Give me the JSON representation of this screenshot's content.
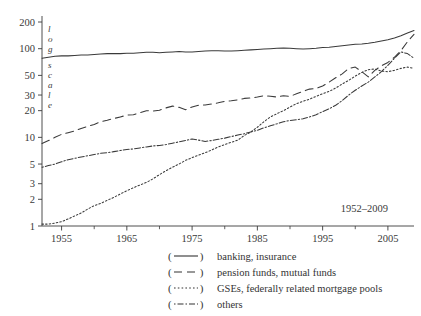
{
  "figure": {
    "period_annotation": "1952–2009",
    "axis_note": "log scale"
  },
  "chart_data": {
    "type": "line",
    "title": "",
    "subtitle": "",
    "xlabel": "",
    "ylabel": "log scale",
    "annotation": "1952–2009",
    "log_y": true,
    "grid": false,
    "legend_position": "below",
    "xlim": [
      1952,
      2009
    ],
    "ylim": [
      1,
      200
    ],
    "x_ticks": [
      1955,
      1965,
      1975,
      1985,
      1995,
      2005
    ],
    "x_tick_labels": [
      "1955",
      "1965",
      "1975",
      "1985",
      "1995",
      "2005"
    ],
    "x_minor_ticks": [
      1960,
      1970,
      1980,
      1990,
      2000
    ],
    "y_ticks": [
      1,
      2,
      3,
      5,
      10,
      20,
      30,
      50,
      100,
      200
    ],
    "y_tick_labels": [
      "1",
      "2",
      "3",
      "5",
      "10",
      "20",
      "30",
      "50",
      "100",
      "200"
    ],
    "x": [
      1952,
      1953,
      1954,
      1955,
      1956,
      1957,
      1958,
      1959,
      1960,
      1961,
      1962,
      1963,
      1964,
      1965,
      1966,
      1967,
      1968,
      1969,
      1970,
      1971,
      1972,
      1973,
      1974,
      1975,
      1976,
      1977,
      1978,
      1979,
      1980,
      1981,
      1982,
      1983,
      1984,
      1985,
      1986,
      1987,
      1988,
      1989,
      1990,
      1991,
      1992,
      1993,
      1994,
      1995,
      1996,
      1997,
      1998,
      1999,
      2000,
      2001,
      2002,
      2003,
      2004,
      2005,
      2006,
      2007,
      2008,
      2009
    ],
    "series": [
      {
        "name": "banking, insurance",
        "style": "solid",
        "values": [
          78,
          80,
          82,
          83,
          83,
          84,
          85,
          85,
          86,
          87,
          88,
          88,
          88,
          89,
          89,
          90,
          91,
          91,
          90,
          91,
          92,
          93,
          92,
          92,
          93,
          94,
          95,
          95,
          94,
          94,
          95,
          96,
          97,
          98,
          99,
          100,
          101,
          102,
          101,
          100,
          99,
          100,
          101,
          103,
          104,
          106,
          108,
          110,
          112,
          113,
          115,
          118,
          122,
          126,
          132,
          140,
          150,
          160
        ]
      },
      {
        "name": "pension funds, mutual funds",
        "style": "dashed",
        "values": [
          8.5,
          9.2,
          10.0,
          10.8,
          11.3,
          11.8,
          12.6,
          13.3,
          14.0,
          15.0,
          15.6,
          16.3,
          17.0,
          17.8,
          18.0,
          19.0,
          20.0,
          19.8,
          20.2,
          21.5,
          22.5,
          21.8,
          20.5,
          22.0,
          23.0,
          23.2,
          23.8,
          24.5,
          25.5,
          25.8,
          26.5,
          27.5,
          27.8,
          28.5,
          29.5,
          29.0,
          28.5,
          29.5,
          29.0,
          31.0,
          33.0,
          35.0,
          35.5,
          38.0,
          42.0,
          47.0,
          52.0,
          60.0,
          62.0,
          55.0,
          48.0,
          57.0,
          64.0,
          70.0,
          80.0,
          95.0,
          120.0,
          145.0
        ]
      },
      {
        "name": "GSEs, federally related mortgage pools",
        "style": "dotted",
        "values": [
          1.05,
          1.05,
          1.08,
          1.12,
          1.2,
          1.3,
          1.4,
          1.55,
          1.7,
          1.8,
          1.95,
          2.1,
          2.3,
          2.5,
          2.7,
          2.9,
          3.1,
          3.4,
          3.8,
          4.2,
          4.6,
          5.0,
          5.5,
          5.9,
          6.3,
          6.7,
          7.2,
          7.8,
          8.3,
          8.8,
          9.3,
          10.5,
          11.5,
          13.0,
          15.0,
          17.0,
          18.5,
          20.0,
          22.0,
          24.0,
          25.5,
          27.0,
          29.0,
          31.0,
          33.0,
          36.0,
          40.0,
          44.0,
          49.0,
          54.0,
          58.0,
          59.0,
          56.0,
          55.0,
          57.0,
          60.0,
          62.0,
          60.0
        ]
      },
      {
        "name": "others",
        "style": "dashdot",
        "values": [
          4.6,
          4.8,
          5.0,
          5.3,
          5.6,
          5.8,
          6.0,
          6.2,
          6.4,
          6.6,
          6.7,
          6.9,
          7.1,
          7.3,
          7.4,
          7.6,
          7.8,
          8.0,
          8.1,
          8.3,
          8.6,
          8.9,
          9.2,
          9.6,
          9.3,
          9.0,
          9.2,
          9.5,
          9.8,
          10.2,
          10.6,
          11.0,
          11.5,
          12.0,
          12.8,
          13.5,
          14.2,
          15.0,
          15.5,
          15.8,
          16.2,
          17.0,
          18.0,
          19.5,
          21.0,
          23.0,
          26.0,
          30.0,
          34.0,
          38.0,
          42.0,
          48.0,
          55.0,
          65.0,
          78.0,
          92.0,
          88.0,
          78.0
        ]
      }
    ]
  },
  "legend": {
    "items": [
      {
        "key_open": "(",
        "key_close": ")",
        "label": "banking, insurance",
        "style": "solid"
      },
      {
        "key_open": "(",
        "key_close": ")",
        "label": "pension funds, mutual funds",
        "style": "dashed"
      },
      {
        "key_open": "(",
        "key_close": ")",
        "label": "GSEs, federally related mortgage pools",
        "style": "dotted"
      },
      {
        "key_open": "(",
        "key_close": ")",
        "label": "others",
        "style": "dashdot"
      }
    ]
  }
}
